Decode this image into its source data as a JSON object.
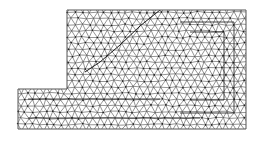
{
  "figure": {
    "type": "triangular-finite-element-mesh",
    "width": 259,
    "height": 142,
    "background": "#ffffff",
    "line_color": "#3a3a3a",
    "node_color": "#1a1a1a",
    "outline_color": "#555555"
  },
  "domain": {
    "outline": [
      [
        67,
        10
      ],
      [
        246,
        10
      ],
      [
        246,
        129
      ],
      [
        18,
        129
      ],
      [
        18,
        89
      ],
      [
        67,
        89
      ]
    ],
    "upper_block": {
      "x": 67,
      "y": 10,
      "w": 179,
      "h": 79
    },
    "lower_strip": {
      "x": 18,
      "y": 89,
      "w": 228,
      "h": 40
    }
  },
  "mesh": {
    "spacing": 7.2,
    "jitter": 0.9
  },
  "feature_lines": [
    {
      "name": "diagonal-interface",
      "points": [
        [
          160,
          10
        ],
        [
          140,
          26
        ],
        [
          120,
          45
        ],
        [
          100,
          62
        ],
        [
          85,
          72
        ]
      ]
    },
    {
      "name": "inner-contour-1",
      "points": [
        [
          180,
          22
        ],
        [
          234,
          22
        ],
        [
          234,
          113
        ],
        [
          180,
          113
        ]
      ]
    },
    {
      "name": "inner-contour-2",
      "points": [
        [
          190,
          32
        ],
        [
          224,
          32
        ],
        [
          224,
          100
        ],
        [
          190,
          100
        ]
      ]
    },
    {
      "name": "lower-strip-contour",
      "points": [
        [
          28,
          99
        ],
        [
          160,
          99
        ]
      ]
    },
    {
      "name": "lower-strip-contour-2",
      "points": [
        [
          28,
          118
        ],
        [
          200,
          118
        ]
      ]
    }
  ]
}
